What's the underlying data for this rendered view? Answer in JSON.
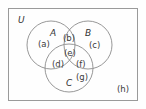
{
  "figure": {
    "type": "venn-diagram-3-set",
    "universe_label": "U",
    "sets": [
      {
        "name": "A",
        "position": "top-left-circle"
      },
      {
        "name": "B",
        "position": "top-right-circle"
      },
      {
        "name": "C",
        "position": "bottom-circle"
      }
    ],
    "regions": [
      {
        "key": "a",
        "label": "(a)",
        "meaning": "A only"
      },
      {
        "key": "b",
        "label": "(b)",
        "meaning": "A and B only"
      },
      {
        "key": "c",
        "label": "(c)",
        "meaning": "B only"
      },
      {
        "key": "d",
        "label": "(d)",
        "meaning": "A and C only"
      },
      {
        "key": "e",
        "label": "(e)",
        "meaning": "A and B and C"
      },
      {
        "key": "f",
        "label": "(f)",
        "meaning": "B and C only"
      },
      {
        "key": "g",
        "label": "(g)",
        "meaning": "C only"
      },
      {
        "key": "h",
        "label": "(h)",
        "meaning": "outside all sets"
      }
    ],
    "colors": {
      "stroke": "#8c8c8c",
      "frame": "#9a9a9a",
      "text": "#3b3b3b",
      "background": "#fefefe"
    }
  }
}
